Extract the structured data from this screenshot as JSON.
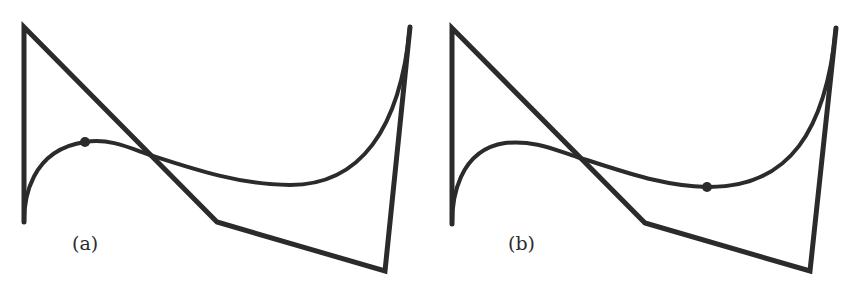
{
  "figure": {
    "panels": [
      {
        "id": "a",
        "label": "(a)",
        "label_pos": [
          72,
          232
        ],
        "control_polygon": [
          [
            24,
            222
          ],
          [
            24,
            27
          ],
          [
            217,
            222
          ],
          [
            385,
            271
          ],
          [
            410,
            27
          ]
        ],
        "curve_path": "M24,222 C24,200 30,150 85,142 C110,138 130,148 150,155 C190,168 240,185 290,185 C360,185 400,130 410,27",
        "marked_point": [
          85,
          142
        ]
      },
      {
        "id": "b",
        "label": "(b)",
        "label_pos": [
          508,
          232
        ],
        "control_polygon": [
          [
            452,
            224
          ],
          [
            452,
            28
          ],
          [
            645,
            223
          ],
          [
            810,
            271
          ],
          [
            836,
            28
          ]
        ],
        "curve_path": "M452,224 C452,200 458,150 505,143 C535,140 555,150 577,157 C620,170 660,186 707,187 C790,188 826,130 836,28",
        "marked_point": [
          707,
          187
        ]
      }
    ],
    "colors": {
      "stroke": "#2b2b2b",
      "background": "#ffffff"
    }
  }
}
